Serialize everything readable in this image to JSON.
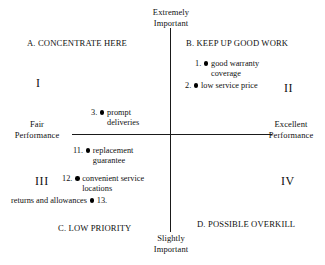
{
  "chart_data": {
    "type": "scatter",
    "xlabel": "Performance",
    "ylabel": "Importance",
    "grid": false,
    "legend": "none",
    "axes": {
      "vertical_top_label": {
        "line1": "Extremely",
        "line2": "Important"
      },
      "vertical_bottom_label": {
        "line1": "Slightly",
        "line2": "Important"
      },
      "horizontal_left_label": {
        "line1": "Fair",
        "line2": "Performance"
      },
      "horizontal_right_label": {
        "line1": "Excellent",
        "line2": "Performance"
      }
    },
    "quadrants": [
      {
        "id": "A",
        "heading": "A. CONCENTRATE HERE",
        "numeral": "I",
        "position": "upper-left"
      },
      {
        "id": "B",
        "heading": "B. KEEP UP GOOD WORK",
        "numeral": "II",
        "position": "upper-right"
      },
      {
        "id": "C",
        "heading": "C. LOW PRIORITY",
        "numeral": "III",
        "position": "lower-left"
      },
      {
        "id": "D",
        "heading": "D. POSSIBLE OVERKILL",
        "numeral": "IV",
        "position": "lower-right"
      }
    ],
    "points": [
      {
        "number": "1.",
        "label_line1": "good warranty",
        "label_line2": "coverage",
        "quadrant": "B"
      },
      {
        "number": "2.",
        "label_line1": "low service price",
        "label_line2": "",
        "quadrant": "B"
      },
      {
        "number": "3.",
        "label_line1": "prompt",
        "label_line2": "deliveries",
        "quadrant": "A"
      },
      {
        "number": "11.",
        "label_line1": "replacement",
        "label_line2": "guarantee",
        "quadrant": "C"
      },
      {
        "number": "12.",
        "label_line1": "convenient service",
        "label_line2": "locations",
        "quadrant": "C"
      },
      {
        "number": "13.",
        "label_line1": "returns and allowances",
        "label_line2": "",
        "quadrant": "C"
      }
    ],
    "point_marker_color": "#000000",
    "axis_color": "#1a1a1a"
  },
  "axis": {
    "top": {
      "line1": "Extremely",
      "line2": "Important"
    },
    "bottom": {
      "line1": "Slightly",
      "line2": "Important"
    },
    "left": {
      "line1": "Fair",
      "line2": "Performance"
    },
    "right": {
      "line1": "Excellent",
      "line2": "Performance"
    }
  },
  "quadrants": {
    "a_heading": "A. CONCENTRATE HERE",
    "b_heading": "B. KEEP UP GOOD WORK",
    "c_heading": "C. LOW PRIORITY",
    "d_heading": "D. POSSIBLE OVERKILL",
    "numeral_i": "I",
    "numeral_ii": "II",
    "numeral_iii": "III",
    "numeral_iv": "IV"
  },
  "points": {
    "p1": {
      "num": "1.",
      "l1": "good warranty",
      "l2": "coverage"
    },
    "p2": {
      "num": "2.",
      "l1": "low service price",
      "l2": ""
    },
    "p3": {
      "num": "3.",
      "l1": "prompt",
      "l2": "deliveries"
    },
    "p11": {
      "num": "11.",
      "l1": "replacement",
      "l2": "guarantee"
    },
    "p12": {
      "num": "12.",
      "l1": "convenient service",
      "l2": "locations"
    },
    "p13": {
      "num": "13.",
      "l1": "returns and allowances",
      "l2": ""
    }
  }
}
